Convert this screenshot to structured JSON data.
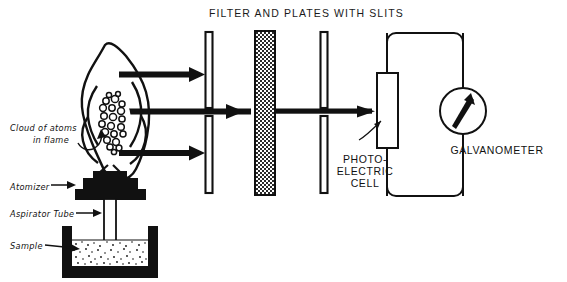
{
  "figure": {
    "title": "FILTER AND PLATES WITH SLITS",
    "ink_color": "#111111",
    "background_color": "#ffffff"
  },
  "labels": {
    "cloud_line1": "Cloud of atoms",
    "cloud_line2": "in flame",
    "atomizer": "Atomizer",
    "aspirator_tube": "Aspirator Tube",
    "sample": "Sample",
    "photocell_line1": "PHOTO-",
    "photocell_line2": "ELECTRIC",
    "photocell_line3": "CELL",
    "galvanometer": "GALVANOMETER"
  },
  "components": {
    "flame": "flame",
    "atom_cloud": "cloud-of-atoms",
    "atomizer_block": "atomizer",
    "aspirator": "aspirator-tube",
    "beaker": "sample-beaker",
    "slit_plates": [
      "plate-upper-left",
      "plate-lower-left",
      "plate-upper-right",
      "plate-lower-right"
    ],
    "filter": "optical-filter",
    "photocell": "photo-electric-cell",
    "galvanometer": "galvanometer",
    "light_beams": [
      "beam-upper",
      "beam-middle",
      "beam-lower"
    ],
    "circuit": "circuit-loop"
  }
}
